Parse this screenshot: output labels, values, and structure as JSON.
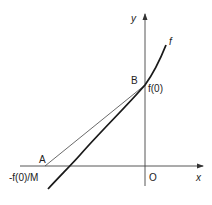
{
  "diagram": {
    "axes": {
      "x_label": "x",
      "y_label": "y",
      "origin_label": "O"
    },
    "curve": {
      "label": "f"
    },
    "points": {
      "A": {
        "label": "A",
        "value_label": "-f(0)/M"
      },
      "B": {
        "label": "B",
        "value_label": "f(0)"
      }
    },
    "labels": {
      "neg_f0_over_M": "-f(0)/M",
      "f0": "f(0)"
    },
    "colors": {
      "ink": "#222222",
      "background": "#ffffff"
    }
  }
}
